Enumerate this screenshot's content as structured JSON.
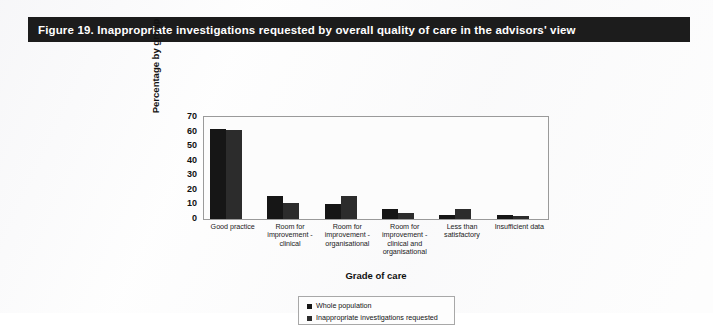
{
  "figure": {
    "title": "Figure 19. Inappropriate investigations requested by overall quality of care in the advisors' view",
    "title_bar_color": "#1c1c1c",
    "title_text_color": "#ffffff",
    "page_background": "#fdfdfd"
  },
  "chart_data": {
    "type": "bar",
    "title": "Figure 19. Inappropriate investigations requested by overall quality of care in the advisors' view",
    "subtitle": "",
    "xlabel": "Grade of care",
    "ylabel": "Percentage by group",
    "categories": [
      "Good practice",
      "Room for improvement - clinical",
      "Room for improvement - organisational",
      "Room for improvement - clinical and organisational",
      "Less than satisfactory",
      "Insufficient data"
    ],
    "series": [
      {
        "name": "Whole population",
        "color": "#161616",
        "values": [
          62,
          16,
          10,
          7,
          3,
          3
        ]
      },
      {
        "name": "Inappropriate investigations requested",
        "color": "#2c2c2c",
        "values": [
          61,
          11,
          16,
          4,
          7,
          2
        ]
      }
    ],
    "ylim": [
      0,
      70
    ],
    "yticks": [
      0,
      10,
      20,
      30,
      40,
      50,
      60,
      70
    ],
    "ytick_labels": [
      "0",
      "10",
      "20",
      "30",
      "40",
      "50",
      "60",
      "70"
    ],
    "grid": false,
    "legend_position": "bottom-center",
    "plot_frame": true,
    "annotations": []
  },
  "axes": {
    "y_title": "Percentage by group",
    "x_title": "Grade of care"
  },
  "xcategories_wrapped": [
    [
      "Good practice"
    ],
    [
      "Room for",
      "improvement -",
      "clinical"
    ],
    [
      "Room for",
      "improvement -",
      "organisational"
    ],
    [
      "Room for",
      "improvement -",
      "clinical and",
      "organisational"
    ],
    [
      "Less than",
      "satisfactory"
    ],
    [
      "Insufficient data"
    ]
  ],
  "legend": {
    "entries": [
      {
        "label": "Whole population",
        "color": "#161616"
      },
      {
        "label": "Inappropriate investigations requested",
        "color": "#2c2c2c"
      }
    ]
  }
}
